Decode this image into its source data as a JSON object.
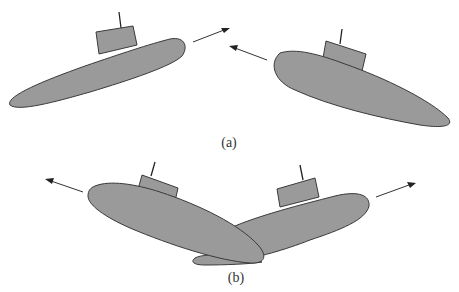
{
  "figure": {
    "colors": {
      "hull_fill": "#9a9a9a",
      "outline": "#3a3a3a",
      "arrow": "#333333",
      "background": "#ffffff"
    },
    "panels": [
      {
        "id": "a",
        "label": "(a)",
        "submarines": [
          {
            "name": "left-submarine",
            "heading": "right",
            "arrow_direction": "up-right"
          },
          {
            "name": "right-submarine",
            "heading": "left",
            "arrow_direction": "up-left"
          }
        ]
      },
      {
        "id": "b",
        "label": "(b)",
        "submarines": [
          {
            "name": "left-submarine",
            "heading": "left",
            "arrow_direction": "up-left"
          },
          {
            "name": "right-submarine",
            "heading": "right",
            "arrow_direction": "up-right"
          }
        ]
      }
    ]
  }
}
